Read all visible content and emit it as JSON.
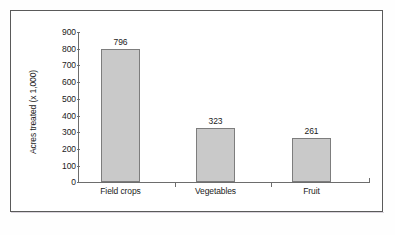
{
  "chart_data": {
    "type": "bar",
    "title": "",
    "subtitle": "",
    "xlabel": "",
    "ylabel": "Acres treated (x 1,000)",
    "categories": [
      "Field crops",
      "Vegetables",
      "Fruit"
    ],
    "values": [
      796,
      323,
      261
    ],
    "data_labels": [
      "796",
      "323",
      "261"
    ],
    "ylim": [
      0,
      900
    ],
    "ytick_values": [
      0,
      100,
      200,
      300,
      400,
      500,
      600,
      700,
      800,
      900
    ],
    "ytick_labels": [
      "0",
      "100",
      "200",
      "300",
      "400",
      "500",
      "600",
      "700",
      "800",
      "900"
    ],
    "grid": false,
    "legend": false,
    "legend_position": "none",
    "bar_fill_color": "#c9c9c9",
    "bar_border_color": "#7d7d7d",
    "axis_color": "#6d6d6d",
    "text_color": "#1b1b1b",
    "plot_background": "#ffffff",
    "frame_border_color": "#5a5a5a"
  }
}
